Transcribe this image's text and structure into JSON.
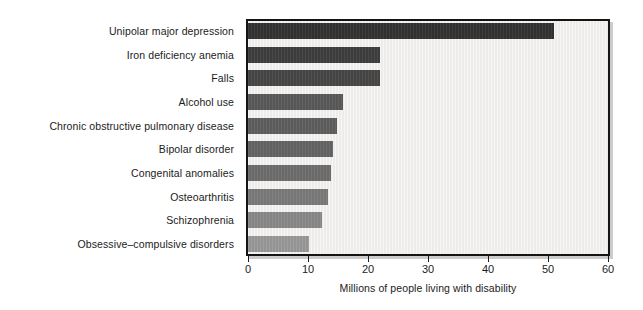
{
  "chart_data": {
    "type": "bar",
    "orientation": "horizontal",
    "title": "",
    "xlabel": "Millions of people living with disability",
    "ylabel": "",
    "xlim": [
      0,
      60
    ],
    "xticks": [
      0,
      10,
      20,
      30,
      40,
      50,
      60
    ],
    "xtick_labels": [
      "0",
      "10",
      "20",
      "30",
      "40",
      "50",
      "60"
    ],
    "grid": false,
    "legend": "none",
    "categories": [
      "Unipolar major depression",
      "Iron deficiency anemia",
      "Falls",
      "Alcohol use",
      "Chronic obstructive pulmonary disease",
      "Bipolar disorder",
      "Congenital anomalies",
      "Osteoarthritis",
      "Schizophrenia",
      "Obsessive–compulsive disorders"
    ],
    "values": [
      51,
      22,
      22,
      15.8,
      14.9,
      14.2,
      13.9,
      13.4,
      12.4,
      10.1
    ],
    "bar_colors": [
      "#333333",
      "#3f3f3f",
      "#474747",
      "#5a5a5a",
      "#5f5f5f",
      "#656565",
      "#6e6e6e",
      "#7b7b7b",
      "#8a8a8a",
      "#9a9a9a"
    ],
    "plot_background": "#eceae7",
    "axis_color": "#141414",
    "text_color": "#1b1b1b"
  }
}
